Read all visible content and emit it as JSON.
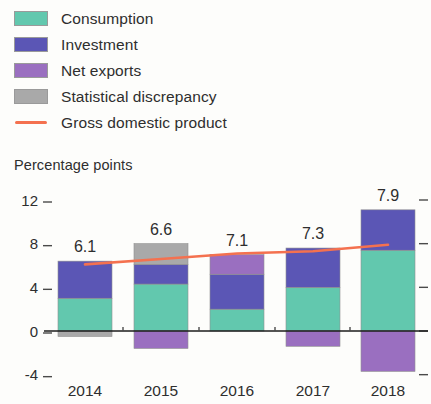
{
  "legend": {
    "items": [
      {
        "label": "Consumption",
        "marker": "swatch",
        "color": "#62c8ae"
      },
      {
        "label": "Investment",
        "marker": "swatch",
        "color": "#5b56b5"
      },
      {
        "label": "Net exports",
        "marker": "swatch",
        "color": "#9a6fc0"
      },
      {
        "label": "Statistical discrepancy",
        "marker": "swatch",
        "color": "#a9a9a9"
      },
      {
        "label": "Gross domestic product",
        "marker": "line",
        "color": "#f4714f"
      }
    ]
  },
  "axis_title": "Percentage points",
  "chart_data": {
    "type": "bar",
    "title": "",
    "subtitle": "",
    "xlabel": "",
    "ylabel": "Percentage points",
    "categories": [
      "2014",
      "2015",
      "2016",
      "2017",
      "2018"
    ],
    "ylim": [
      -4,
      12
    ],
    "yticks": [
      -4,
      0,
      4,
      8,
      12
    ],
    "ytick_labels": [
      "-4",
      "0",
      "4",
      "8",
      "12"
    ],
    "grid": false,
    "legend_position": "top-left",
    "stacked": true,
    "series": [
      {
        "name": "Consumption",
        "color": "#62c8ae",
        "values": [
          3.0,
          4.3,
          2.0,
          4.0,
          7.4
        ]
      },
      {
        "name": "Investment",
        "color": "#5b56b5",
        "values": [
          3.4,
          1.8,
          3.2,
          3.6,
          3.7
        ]
      },
      {
        "name": "Net exports",
        "color": "#9a6fc0",
        "values": [
          0.0,
          -1.6,
          1.8,
          -1.4,
          -3.7
        ]
      },
      {
        "name": "Statistical discrepancy",
        "color": "#a9a9a9",
        "values": [
          -0.5,
          1.9,
          0.0,
          0.0,
          0.0
        ]
      }
    ],
    "line_series": {
      "name": "Gross domestic product",
      "color": "#f4714f",
      "values": [
        6.1,
        6.6,
        7.1,
        7.3,
        7.9
      ]
    },
    "data_labels": [
      "6.1",
      "6.6",
      "7.1",
      "7.3",
      "7.9"
    ]
  }
}
